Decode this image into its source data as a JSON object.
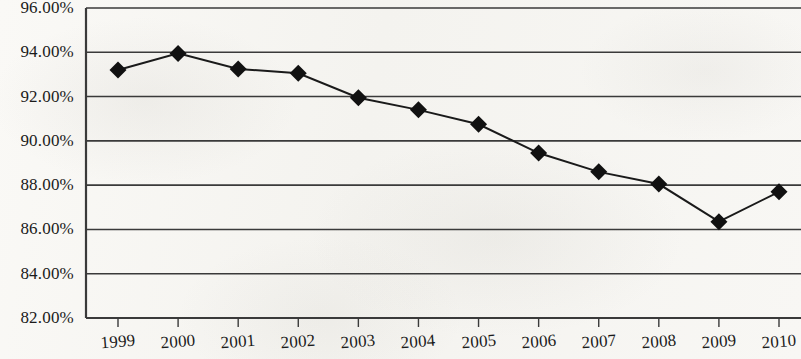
{
  "chart_data": {
    "type": "line",
    "title": "",
    "subtitle": "",
    "xlabel": "",
    "ylabel": "",
    "categories": [
      "1999",
      "2000",
      "2001",
      "2002",
      "2003",
      "2004",
      "2005",
      "2006",
      "2007",
      "2008",
      "2009",
      "2010"
    ],
    "series": [
      {
        "name": "",
        "values": [
          93.2,
          93.95,
          93.25,
          93.05,
          91.95,
          91.4,
          90.75,
          89.45,
          88.6,
          88.05,
          86.35,
          87.7
        ]
      }
    ],
    "ytick_labels": [
      "96.00%",
      "94.00%",
      "92.00%",
      "90.00%",
      "88.00%",
      "86.00%",
      "84.00%",
      "82.00%"
    ],
    "ytick_values": [
      96,
      94,
      92,
      90,
      88,
      86,
      84,
      82
    ],
    "ylim": [
      82,
      96
    ],
    "ytick_step": 2,
    "grid": true,
    "grid_axis": "y",
    "legend": false,
    "legend_position": "none",
    "marker": "diamond",
    "marker_color": "#111111",
    "line_color": "#1a1a1a",
    "axis_color": "#3a3a3a",
    "background_color": "#f7f6f3",
    "xlabel_rotation_deg": -4.5
  },
  "axes": {
    "y_axis_name": "percent-axis",
    "x_axis_name": "year-axis"
  }
}
